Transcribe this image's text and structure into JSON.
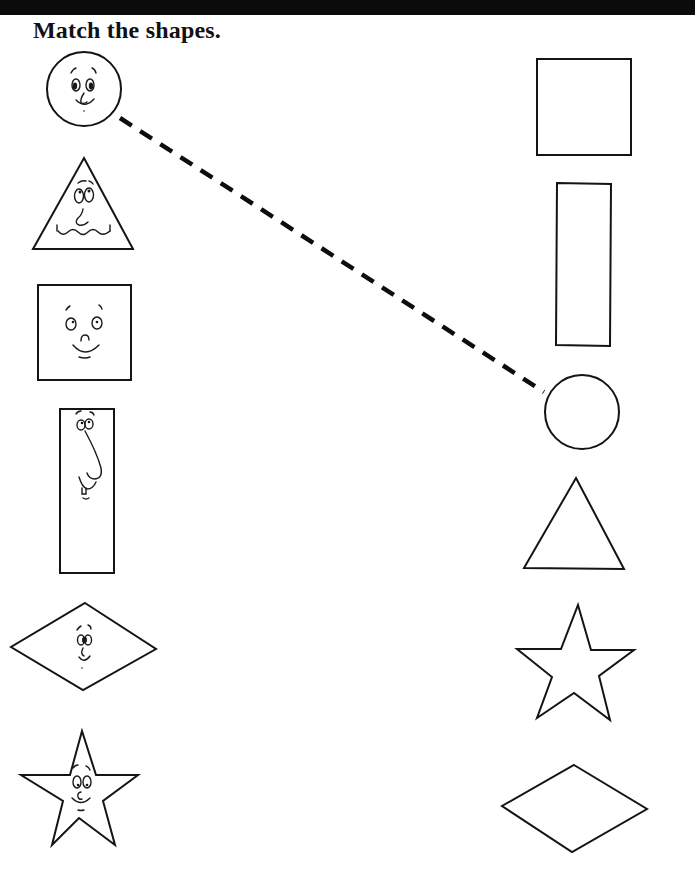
{
  "worksheet": {
    "title": "Match the shapes.",
    "colors": {
      "ink": "#141414",
      "background": "#ffffff",
      "top_bar": "#0b0b0b"
    },
    "left_column": [
      {
        "shape": "circle",
        "has_face": true
      },
      {
        "shape": "triangle",
        "has_face": true
      },
      {
        "shape": "square",
        "has_face": true
      },
      {
        "shape": "rectangle",
        "has_face": true
      },
      {
        "shape": "diamond",
        "has_face": true
      },
      {
        "shape": "star",
        "has_face": true
      }
    ],
    "right_column": [
      {
        "shape": "square",
        "has_face": false
      },
      {
        "shape": "rectangle",
        "has_face": false
      },
      {
        "shape": "circle",
        "has_face": false
      },
      {
        "shape": "triangle",
        "has_face": false
      },
      {
        "shape": "star",
        "has_face": false
      },
      {
        "shape": "diamond",
        "has_face": false
      }
    ],
    "example_match": {
      "from": "left circle",
      "to": "right circle",
      "style": "dashed"
    }
  }
}
